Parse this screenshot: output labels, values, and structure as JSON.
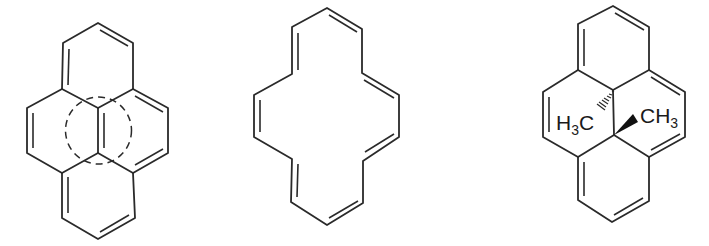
{
  "figure": {
    "structures": [
      {
        "id": "pyrene",
        "description": "Pyrene drawn with dashed circle indicating aromatic delocalization in central region",
        "annotations": []
      },
      {
        "id": "annulene",
        "description": "[14]annulene macrocycle with alternating double bonds",
        "annotations": []
      },
      {
        "id": "dimethyldihydropyrene",
        "description": "trans-15,16-dimethyldihydropyrene",
        "annotations": [
          {
            "label_main": "H",
            "label_sub": "3",
            "label_tail": "C",
            "stereo": "hashed-wedge"
          },
          {
            "label_main": "CH",
            "label_sub": "3",
            "stereo": "solid-wedge"
          }
        ]
      }
    ],
    "colors": {
      "bond": "#2a2a2a",
      "background": "#ffffff"
    }
  }
}
